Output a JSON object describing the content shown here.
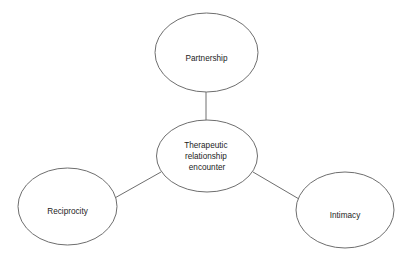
{
  "diagram": {
    "type": "hub-and-spoke concept map",
    "background_color": "#ffffff",
    "stroke_color": "#6e6e6e",
    "text_color": "#1c1c1c",
    "center_node": {
      "id": "therapeutic-relationship-encounter",
      "lines": [
        "Therapeutic",
        "relationship",
        "encounter"
      ],
      "full_label": "Therapeutic relationship encounter"
    },
    "outer_nodes": [
      {
        "id": "partnership",
        "label": "Partnership",
        "position": "top"
      },
      {
        "id": "reciprocity",
        "label": "Reciprocity",
        "position": "bottom-left"
      },
      {
        "id": "intimacy",
        "label": "Intimacy",
        "position": "bottom-right"
      }
    ],
    "connectors": [
      {
        "id": "center-to-partnership",
        "from": "therapeutic-relationship-encounter",
        "to": "partnership"
      },
      {
        "id": "center-to-reciprocity",
        "from": "therapeutic-relationship-encounter",
        "to": "reciprocity"
      },
      {
        "id": "center-to-intimacy",
        "from": "therapeutic-relationship-encounter",
        "to": "intimacy"
      }
    ]
  }
}
